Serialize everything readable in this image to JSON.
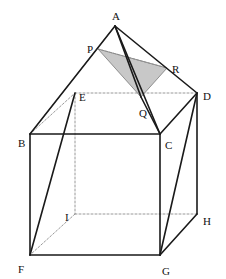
{
  "figure": {
    "background_color": "#ffffff",
    "stroke_color": "#1a1a1a",
    "hidden_stroke_color": "#888888",
    "shade_fill": "#c8c8c8",
    "shade_stroke": "#7a7a7a",
    "canvas": {
      "width": 226,
      "height": 279
    }
  },
  "labels": {
    "A": "A",
    "B": "B",
    "C": "C",
    "D": "D",
    "E": "E",
    "F": "F",
    "G": "G",
    "H": "H",
    "I": "I",
    "P": "P",
    "Q": "Q",
    "R": "R"
  },
  "chart_data": {
    "type": "diagram",
    "points": {
      "A": [
        115,
        26
      ],
      "B": [
        30,
        134
      ],
      "C": [
        160,
        134
      ],
      "D": [
        197,
        93
      ],
      "E": [
        75,
        93
      ],
      "F": [
        30,
        255
      ],
      "G": [
        160,
        255
      ],
      "H": [
        197,
        214
      ],
      "I": [
        75,
        214
      ],
      "P": [
        98,
        49
      ],
      "Q": [
        141,
        97
      ],
      "R": [
        167,
        68
      ]
    },
    "solid_edges": [
      [
        "A",
        "B"
      ],
      [
        "A",
        "D"
      ],
      [
        "A",
        "C"
      ],
      [
        "A",
        "Q"
      ],
      [
        "B",
        "C"
      ],
      [
        "C",
        "D"
      ],
      [
        "B",
        "F"
      ],
      [
        "C",
        "G"
      ],
      [
        "D",
        "H"
      ],
      [
        "F",
        "G"
      ],
      [
        "G",
        "H"
      ],
      [
        "D",
        "G"
      ],
      [
        "E",
        "F"
      ],
      [
        "Q",
        "C"
      ]
    ],
    "hidden_edges": [
      [
        "B",
        "E"
      ],
      [
        "E",
        "D"
      ],
      [
        "E",
        "I"
      ],
      [
        "I",
        "F"
      ],
      [
        "I",
        "H"
      ],
      [
        "B",
        "A"
      ],
      [
        "P",
        "R"
      ]
    ],
    "shaded_polygon": [
      "P",
      "R",
      "Q"
    ],
    "labeled_points": [
      "A",
      "B",
      "C",
      "D",
      "E",
      "F",
      "G",
      "H",
      "I",
      "P",
      "Q",
      "R"
    ]
  }
}
